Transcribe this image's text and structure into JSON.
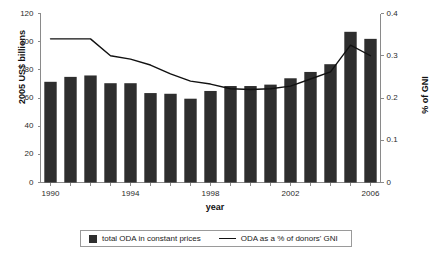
{
  "chart_data": {
    "type": "bar",
    "title": "",
    "xlabel": "year",
    "ylabel": "2005 US$ billions",
    "y2label": "% of GNI",
    "grid": false,
    "legend_position": "bottom",
    "categories": [
      1990,
      1991,
      1992,
      1993,
      1994,
      1995,
      1996,
      1997,
      1998,
      1999,
      2000,
      2001,
      2002,
      2003,
      2004,
      2005,
      2006
    ],
    "xtick_labels": [
      "1990",
      "1994",
      "1998",
      "2002",
      "2006"
    ],
    "xtick_values": [
      1990,
      1994,
      1998,
      2002,
      2006
    ],
    "xlim": [
      1989.5,
      2006.5
    ],
    "ylim": [
      0,
      120
    ],
    "ytick_labels": [
      "0",
      "20",
      "40",
      "60",
      "80",
      "100",
      "120"
    ],
    "ytick_values": [
      0,
      20,
      40,
      60,
      80,
      100,
      120
    ],
    "y2lim": [
      0,
      0.4
    ],
    "y2tick_labels": [
      "0",
      "0.1",
      "0.2",
      "0.3",
      "0.4"
    ],
    "y2tick_values": [
      0,
      0.1,
      0.2,
      0.3,
      0.4
    ],
    "series": [
      {
        "name": "total ODA in constant prices",
        "type": "bar",
        "axis": "left",
        "color": "#2e2e2e",
        "values": [
          71.5,
          75.0,
          76.0,
          70.5,
          70.5,
          63.5,
          63.0,
          59.5,
          65.0,
          68.5,
          68.5,
          69.5,
          74.0,
          78.5,
          84.0,
          107.0,
          102.0
        ]
      },
      {
        "name": "ODA as a % of donors' GNI",
        "type": "line",
        "axis": "right",
        "color": "#111111",
        "values": [
          0.34,
          0.34,
          0.34,
          0.3,
          0.292,
          0.278,
          0.257,
          0.24,
          0.233,
          0.222,
          0.22,
          0.222,
          0.228,
          0.245,
          0.262,
          0.325,
          0.3
        ]
      }
    ]
  },
  "legend": {
    "bars_label": "total ODA in constant prices",
    "line_label": "ODA as a % of donors' GNI"
  },
  "axes": {
    "left_title": "2005 US$ billions",
    "right_title": "% of GNI",
    "bottom_title": "year"
  }
}
